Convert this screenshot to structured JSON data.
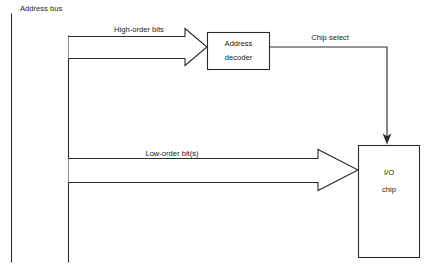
{
  "diagram": {
    "colors": {
      "line": "#2b2b2b",
      "text": "#1a1a1a",
      "background": "#ffffff",
      "shape_fill": "#ffffff"
    },
    "bus_label": "Address bus",
    "signals": {
      "high_order": "High-order bits",
      "chip_select": "Chip select",
      "low_order": "Low-order bit(s)"
    },
    "blocks": {
      "decoder": {
        "line1": "Address",
        "line2": "decoder"
      },
      "io_chip": {
        "line1": "I/O",
        "line2": "chip"
      }
    }
  }
}
